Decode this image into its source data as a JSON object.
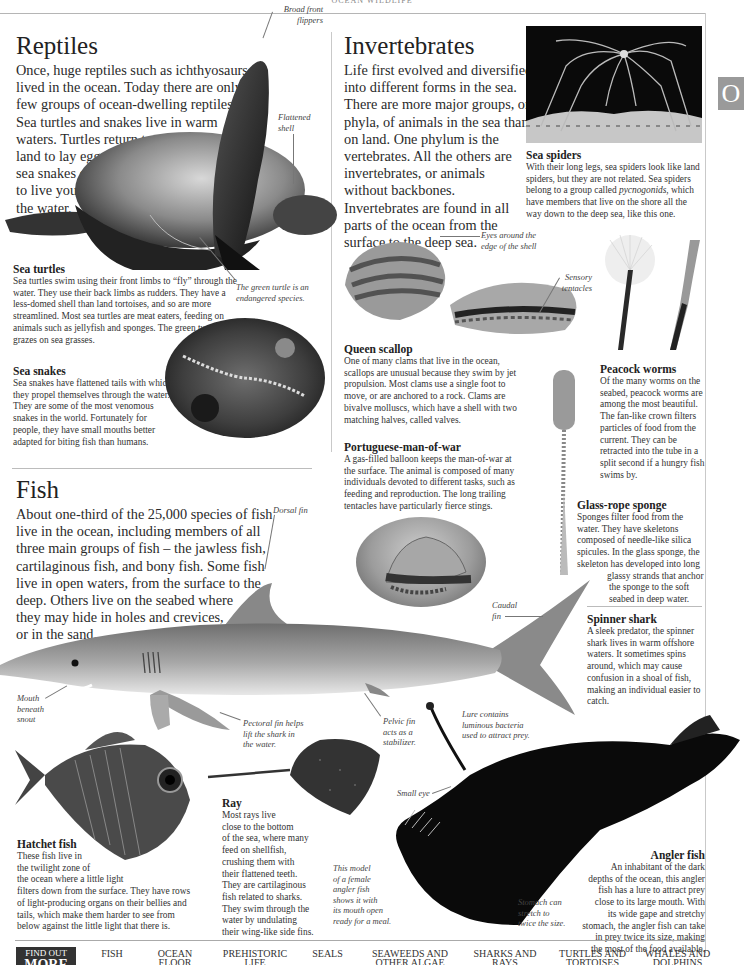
{
  "page": {
    "running_head": "OCEAN WILDLIFE",
    "thumb_tab_letter": "O"
  },
  "reptiles": {
    "title": "Reptiles",
    "lead_lines": [
      "Once, huge reptiles such as ichthyosaurs",
      "lived in the ocean. Today there are only a",
      "few groups of ocean-dwelling reptiles.",
      "Sea turtles and snakes live in warm",
      "waters. Turtles return to",
      "land to lay eggs; most",
      "sea snakes give birth",
      "to live young in",
      "the water."
    ],
    "labels": {
      "broad_front_flippers": [
        "Broad front",
        "flippers"
      ],
      "flattened_shell": [
        "Flattened",
        "shell"
      ],
      "green_turtle": [
        "The green turtle is an",
        "endangered species."
      ]
    },
    "sea_turtles": {
      "heading": "Sea turtles",
      "text": "Sea turtles swim using their front limbs to “fly” through the water. They use their back limbs as rudders. They have a less-domed shell than land tortoises, and so are more streamlined. Most sea turtles are meat eaters, feeding on animals such as jellyfish and sponges. The green turtle grazes on sea grasses."
    },
    "sea_snakes": {
      "heading": "Sea snakes",
      "text": "Sea snakes have flattened tails with which they propel themselves through the water. They are some of the most venomous snakes in the world. Fortunately for people, they have small mouths better adapted for biting fish than humans."
    }
  },
  "invertebrates": {
    "title": "Invertebrates",
    "lead_lines": [
      "Life first evolved and diversified",
      "into different forms in the sea.",
      "There are more major groups, or",
      "phyla, of animals in the sea than",
      "on land. One phylum is the",
      "vertebrates. All the others are",
      "invertebrates, or animals",
      "without backbones.",
      "Invertebrates are found in all",
      "parts of the ocean from the",
      "surface to the deep sea."
    ],
    "sea_spiders": {
      "heading": "Sea spiders",
      "text_before": "With their long legs, sea spiders look like land spiders, but they are not related. Sea spiders belong to a group called ",
      "text_italic": "pycnogonids",
      "text_after": ", which have members that live on the shore all the way down to the deep sea, like this one."
    },
    "labels": {
      "eyes_around_shell": [
        "Eyes around the",
        "edge of the shell"
      ],
      "sensory_tentacles": [
        "Sensory",
        "tentacles"
      ]
    },
    "queen_scallop": {
      "heading": "Queen scallop",
      "text": "One of many clams that live in the ocean, scallops are unusual because they swim by jet propulsion. Most clams use a single foot to move, or are anchored to a rock. Clams are bivalve molluscs, which have a shell with two matching halves, called valves."
    },
    "peacock_worms": {
      "heading": "Peacock worms",
      "text": "Of the many worms on the seabed, peacock worms are among the most beautiful. The fan-like crown filters particles of food from the current. They can be retracted into the tube in a split second if a hungry fish swims by."
    },
    "man_of_war": {
      "heading": "Portuguese-man-of-war",
      "text": "A gas-filled balloon keeps the man-of-war at the surface. The animal is composed of many individuals devoted to different tasks, such as feeding and reproduction. The long trailing tentacles have particularly fierce stings."
    },
    "glass_rope_sponge": {
      "heading": "Glass-rope sponge",
      "text_lines": [
        "Sponges filter food from the",
        "water. They have skeletons",
        "composed of needle-like silica",
        "spicules. In the glass sponge, the",
        "skeleton has developed into long",
        "glassy strands that anchor",
        "the sponge to the soft",
        "seabed in deep water."
      ]
    }
  },
  "fish": {
    "title": "Fish",
    "lead_lines": [
      "About one-third of the 25,000 species of fish",
      "live in the ocean, including members of all",
      "three main groups of fish – the jawless fish,",
      "cartilaginous fish, and bony fish. Some fish",
      "live in open waters, from the surface to the",
      "deep. Others live on the seabed where",
      "they may hide in holes and crevices,",
      "or in the sand."
    ],
    "labels": {
      "dorsal_fin": "Dorsal fin",
      "caudal_fin": [
        "Caudal",
        "fin"
      ],
      "mouth_beneath_snout": [
        "Mouth",
        "beneath",
        "snout"
      ],
      "pectoral_fin": [
        "Pectoral fin helps",
        "lift the shark in",
        "the water."
      ],
      "pelvic_fin": [
        "Pelvic fin",
        "acts as a",
        "stabilizer."
      ],
      "lure": [
        "Lure contains",
        "luminous bacteria",
        "used to attract prey."
      ],
      "small_eye": "Small eye",
      "female_model": [
        "This model",
        "of a female",
        "angler fish",
        "shows it with",
        "its mouth open",
        "ready for a meal."
      ],
      "stomach": [
        "Stomach can",
        "stretch to",
        "twice the size."
      ]
    },
    "spinner_shark": {
      "heading": "Spinner shark",
      "text": "A sleek predator, the spinner shark lives in warm offshore waters. It sometimes spins around, which may cause confusion in a shoal of fish, making an individual easier to catch."
    },
    "hatchet_fish": {
      "heading": "Hatchet fish",
      "text_lines": [
        "These fish live in",
        "the twilight zone of",
        "the ocean where a little light",
        "filters down from the surface. They have rows",
        "of light-producing organs on their bellies and",
        "tails, which make them harder to see from",
        "below against the little light that there is."
      ]
    },
    "ray": {
      "heading": "Ray",
      "text_lines": [
        "Most rays live",
        "close to the bottom",
        "of the sea, where many",
        "feed on shellfish,",
        "crushing them with",
        "their flattened teeth.",
        "They are cartilaginous",
        "fish related to sharks.",
        "They swim through the",
        "water by undulating",
        "their wing-like side fins."
      ]
    },
    "angler_fish": {
      "heading": "Angler fish",
      "text_lines": [
        "An inhabitant of the dark",
        "depths of the ocean, this angler",
        "fish has a lure to attract prey",
        "close to its large mouth. With",
        "its wide gape and stretchy",
        "stomach, the angler fish can take",
        "in prey twice its size, making",
        "the most of the food available."
      ]
    }
  },
  "footer": {
    "find_out": "FIND OUT",
    "more": "MORE",
    "links": [
      [
        "Fish"
      ],
      [
        "Ocean",
        "floor"
      ],
      [
        "Prehistoric",
        "life"
      ],
      [
        "Seals"
      ],
      [
        "Seaweeds and",
        "other algae"
      ],
      [
        "Sharks and",
        "rays"
      ],
      [
        "Turtles and",
        "tortoises"
      ],
      [
        "Whales and",
        "dolphins"
      ]
    ]
  }
}
